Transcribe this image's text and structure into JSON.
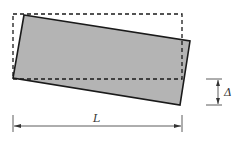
{
  "diagram": {
    "labels": {
      "length": "L",
      "displacement": "Δ"
    },
    "colors": {
      "fill": "#b4b4b4",
      "stroke": "#1a1a1a",
      "background": "#ffffff"
    }
  }
}
